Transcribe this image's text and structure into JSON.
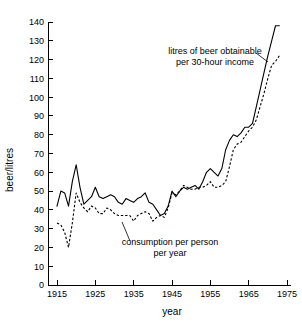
{
  "chart_data": {
    "type": "line",
    "title": "",
    "xlabel": "year",
    "ylabel": "beer/litres",
    "xlim": [
      1915,
      1975
    ],
    "ylim": [
      0,
      140
    ],
    "grid": false,
    "legend_position": "inline-annotations",
    "xticks": [
      1915,
      1925,
      1935,
      1945,
      1955,
      1965,
      1975
    ],
    "yticks": [
      0,
      10,
      20,
      30,
      40,
      50,
      60,
      70,
      80,
      90,
      100,
      110,
      120,
      130,
      140
    ],
    "xtick_labels": [
      "1915",
      "1925",
      "1935",
      "1945",
      "1955",
      "1965",
      "1975"
    ],
    "ytick_labels": [
      "0",
      "10",
      "20",
      "30",
      "40",
      "50",
      "60",
      "70",
      "80",
      "90",
      "100",
      "110",
      "120",
      "130",
      "140"
    ],
    "annotations": [
      {
        "name": "solid-series-annotation",
        "text_line1": "litres of beer obtainable",
        "text_line2": "per 30-hour income",
        "points_to_year": 1970
      },
      {
        "name": "dashed-series-annotation",
        "text_line1": "consumption per person",
        "text_line2": "per year",
        "points_to_year": 1934
      }
    ],
    "x": [
      1915,
      1916,
      1917,
      1918,
      1919,
      1920,
      1921,
      1922,
      1923,
      1924,
      1925,
      1926,
      1927,
      1928,
      1929,
      1930,
      1931,
      1932,
      1933,
      1934,
      1935,
      1936,
      1937,
      1938,
      1939,
      1940,
      1941,
      1942,
      1943,
      1944,
      1945,
      1946,
      1947,
      1948,
      1949,
      1950,
      1951,
      1952,
      1953,
      1954,
      1955,
      1956,
      1957,
      1958,
      1959,
      1960,
      1961,
      1962,
      1963,
      1964,
      1965,
      1966,
      1967,
      1968,
      1969,
      1970,
      1971,
      1972,
      1973
    ],
    "series": [
      {
        "name": "litres of beer obtainable per 30-hour income",
        "style": "solid",
        "values": [
          42,
          50,
          49,
          42,
          55,
          64,
          52,
          43,
          45,
          47,
          52,
          47,
          46,
          47,
          48,
          47,
          44,
          43,
          46,
          45,
          44,
          46,
          47,
          49,
          44,
          43,
          40,
          37,
          38,
          42,
          50,
          47,
          50,
          52,
          51,
          52,
          53,
          51,
          55,
          60,
          62,
          60,
          58,
          62,
          72,
          77,
          80,
          79,
          81,
          84,
          84,
          86,
          95,
          104,
          113,
          122,
          130,
          138,
          138
        ]
      },
      {
        "name": "consumption per person per year",
        "style": "dashed",
        "values": [
          33,
          32,
          28,
          20,
          33,
          49,
          44,
          41,
          39,
          42,
          41,
          38,
          38,
          41,
          40,
          38,
          37,
          37,
          37,
          37,
          34,
          37,
          38,
          39,
          38,
          34,
          36,
          37,
          36,
          41,
          49,
          48,
          50,
          53,
          52,
          51,
          51,
          52,
          52,
          53,
          55,
          52,
          52,
          53,
          55,
          63,
          72,
          75,
          76,
          79,
          82,
          84,
          88,
          95,
          102,
          110,
          117,
          119,
          122
        ]
      }
    ]
  }
}
